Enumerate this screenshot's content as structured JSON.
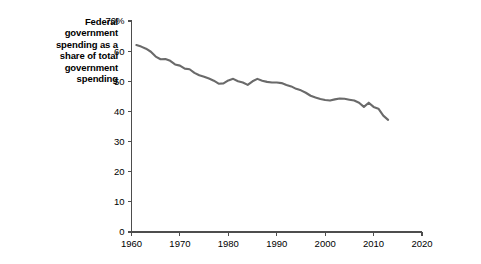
{
  "chart_data": {
    "type": "line",
    "title": "Federal government spending as a share of total government spending",
    "title_lines": "Federal\ngovernment\nspending as a\nshare of total\ngovernment\nspending",
    "xlabel": "",
    "ylabel": "",
    "xlim": [
      1960,
      2020
    ],
    "ylim": [
      0,
      70
    ],
    "grid": false,
    "legend": false,
    "line_color": "#6a6a6a",
    "axis_color": "#4d4d4d",
    "x_ticks": [
      1960,
      1970,
      1980,
      1990,
      2000,
      2010,
      2020
    ],
    "x_tick_labels": [
      "1960",
      "1970",
      "1980",
      "1990",
      "2000",
      "2010",
      "2020"
    ],
    "y_ticks": [
      0,
      10,
      20,
      30,
      40,
      50,
      60,
      70
    ],
    "y_tick_labels": [
      "0",
      "10",
      "20",
      "30",
      "40",
      "50",
      "60",
      "70%"
    ],
    "series": [
      {
        "name": "Federal share of total government spending",
        "units": "percent",
        "x": [
          1961,
          1962,
          1963,
          1964,
          1965,
          1966,
          1967,
          1968,
          1969,
          1970,
          1971,
          1972,
          1973,
          1974,
          1975,
          1976,
          1977,
          1978,
          1979,
          1980,
          1981,
          1982,
          1983,
          1984,
          1985,
          1986,
          1987,
          1988,
          1989,
          1990,
          1991,
          1992,
          1993,
          1994,
          1995,
          1996,
          1997,
          1998,
          1999,
          2000,
          2001,
          2002,
          2003,
          2004,
          2005,
          2006,
          2007,
          2008,
          2009,
          2010,
          2011,
          2012,
          2013
        ],
        "values": [
          62.0,
          61.5,
          60.8,
          59.8,
          58.2,
          57.3,
          57.4,
          56.8,
          55.6,
          55.2,
          54.2,
          54.0,
          52.8,
          52.0,
          51.5,
          50.9,
          50.2,
          49.2,
          49.3,
          50.3,
          50.8,
          50.0,
          49.6,
          48.8,
          50.0,
          50.8,
          50.2,
          49.8,
          49.6,
          49.6,
          49.4,
          48.8,
          48.3,
          47.5,
          47.0,
          46.2,
          45.2,
          44.6,
          44.1,
          43.8,
          43.6,
          44.0,
          44.3,
          44.2,
          43.9,
          43.6,
          42.9,
          41.5,
          42.9,
          41.5,
          40.9,
          38.6,
          37.2
        ]
      }
    ]
  }
}
